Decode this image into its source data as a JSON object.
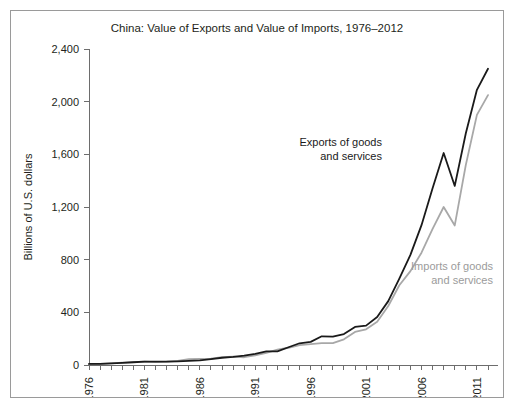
{
  "figure": {
    "title": "China: Value of Exports and Value of Imports, 1976–2012",
    "ylabel": "Billions of U.S. dollars",
    "series_label_exports_line1": "Exports of goods",
    "series_label_exports_line2": "and services",
    "series_label_imports_line1": "Imports of goods",
    "series_label_imports_line2": "and services",
    "color_exports": "#1a1a1a",
    "color_imports": "#a8a8a8",
    "border_color": "#9a9a9a",
    "background": "#ffffff"
  },
  "chart_data": {
    "type": "line",
    "title": "China: Value of Exports and Value of Imports, 1976–2012",
    "xlabel": "",
    "ylabel": "Billions of U.S. dollars",
    "xlim": [
      1976,
      2012
    ],
    "ylim": [
      0,
      2400
    ],
    "ytick_values": [
      0,
      400,
      800,
      1200,
      1600,
      2000,
      2400
    ],
    "ytick_labels": [
      "0",
      "400",
      "800",
      "1,200",
      "1,600",
      "2,000",
      "2,400"
    ],
    "xtick_values": [
      1976,
      1981,
      1986,
      1991,
      1996,
      2001,
      2006,
      2011
    ],
    "xtick_labels": [
      "1976",
      "1981",
      "1986",
      "1991",
      "1996",
      "2001",
      "2006",
      "2011"
    ],
    "xtick_minor_every": 1,
    "xtick_label_rotation": -90,
    "grid": false,
    "legend": "inline-annotations",
    "x": [
      1976,
      1977,
      1978,
      1979,
      1980,
      1981,
      1982,
      1983,
      1984,
      1985,
      1986,
      1987,
      1988,
      1989,
      1990,
      1991,
      1992,
      1993,
      1994,
      1995,
      1996,
      1997,
      1998,
      1999,
      2000,
      2001,
      2002,
      2003,
      2004,
      2005,
      2006,
      2007,
      2008,
      2009,
      2010,
      2011,
      2012
    ],
    "series": [
      {
        "name": "Exports of goods and services",
        "color": "#1a1a1a",
        "values": [
          8,
          9,
          12,
          16,
          21,
          25,
          25,
          25,
          28,
          31,
          35,
          45,
          55,
          61,
          72,
          85,
          103,
          103,
          135,
          165,
          176,
          218,
          215,
          235,
          289,
          299,
          365,
          485,
          656,
          836,
          1062,
          1343,
          1610,
          1360,
          1760,
          2090,
          2250
        ]
      },
      {
        "name": "Imports of goods and services",
        "color": "#a8a8a8",
        "values": [
          7,
          8,
          13,
          18,
          22,
          25,
          22,
          25,
          31,
          45,
          47,
          48,
          60,
          63,
          59,
          73,
          92,
          116,
          131,
          151,
          159,
          166,
          166,
          195,
          251,
          271,
          328,
          448,
          606,
          713,
          853,
          1034,
          1200,
          1060,
          1520,
          1900,
          2050
        ]
      }
    ],
    "annotations": [
      {
        "text": "Exports of goods and services",
        "series": "exports",
        "x": 2006,
        "y": 1560
      },
      {
        "text": "Imports of goods and services",
        "series": "imports",
        "x": 2008,
        "y": 790
      }
    ]
  }
}
